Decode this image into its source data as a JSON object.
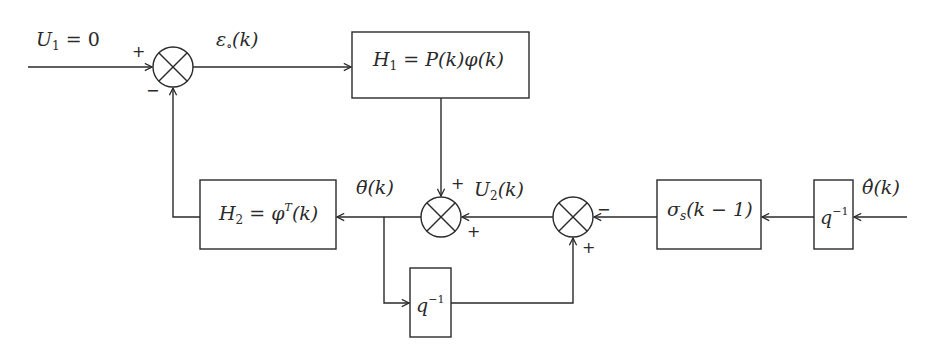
{
  "diagram": {
    "colors": {
      "stroke": "#2a2a2a",
      "background": "#ffffff"
    },
    "signals": {
      "input": {
        "symbol": "U",
        "subscript": "1",
        "rest": " = 0"
      },
      "error": {
        "symbol": "ε",
        "subscript": "∘",
        "rest": "(k)"
      },
      "theta_tilde": {
        "symbol": "θ̃",
        "rest": "(k)"
      },
      "u2": {
        "symbol": "U",
        "subscript": "2",
        "rest": "(k)"
      },
      "theta_hat": {
        "symbol": "θ̂",
        "rest": "(k)"
      }
    },
    "blocks": {
      "h1": {
        "prefix": "H",
        "subscript": "1",
        "rest": " = P(k)φ(k)"
      },
      "h2": {
        "prefix": "H",
        "subscript": "2",
        "mid": " = φ",
        "superscript": "T",
        "rest": "(k)"
      },
      "sigma": {
        "prefix": "σ",
        "subscript": "s",
        "rest": "(k − 1)"
      },
      "delay_right": {
        "base": "q",
        "superscript": "−1"
      },
      "delay_bottom": {
        "base": "q",
        "superscript": "−1"
      }
    },
    "signs": {
      "j1_plus": "+",
      "j1_minus": "−",
      "j2_top_plus": "+",
      "j2_right_plus": "+",
      "j3_right_minus": "−",
      "j3_bottom_plus": "+"
    }
  }
}
